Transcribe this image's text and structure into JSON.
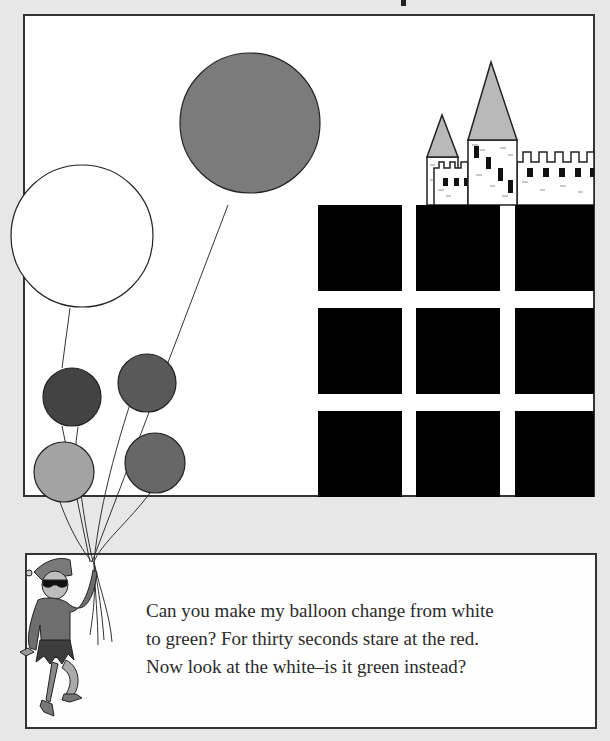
{
  "illustration": {
    "frame": {
      "x": 24,
      "y": 15,
      "width": 570,
      "height": 481,
      "fill": "#ffffff",
      "stroke": "#333333"
    },
    "balloons": [
      {
        "name": "large-gray-balloon",
        "cx": 250,
        "cy": 123,
        "r": 70,
        "fill": "#7b7b7b"
      },
      {
        "name": "white-balloon",
        "cx": 82,
        "cy": 236,
        "r": 71,
        "fill": "#ffffff"
      },
      {
        "name": "dark-balloon",
        "cx": 72,
        "cy": 397,
        "r": 29,
        "fill": "#434343"
      },
      {
        "name": "medium-balloon-upper",
        "cx": 147,
        "cy": 383,
        "r": 29,
        "fill": "#595959"
      },
      {
        "name": "light-balloon",
        "cx": 64,
        "cy": 472,
        "r": 30,
        "fill": "#a3a3a3"
      },
      {
        "name": "medium-balloon-lower",
        "cx": 155,
        "cy": 463,
        "r": 30,
        "fill": "#676767"
      }
    ],
    "grid_squares": {
      "cols": [
        318,
        416,
        515
      ],
      "rows": [
        205,
        308,
        411
      ],
      "size": 84,
      "fill": "#000000"
    },
    "castle_roof_color": "#b9b9b9"
  },
  "caption": {
    "lines": [
      "Can you make my balloon change from white",
      "to green? For thirty seconds stare at the red.",
      "Now look at the white–is it green instead?"
    ]
  }
}
